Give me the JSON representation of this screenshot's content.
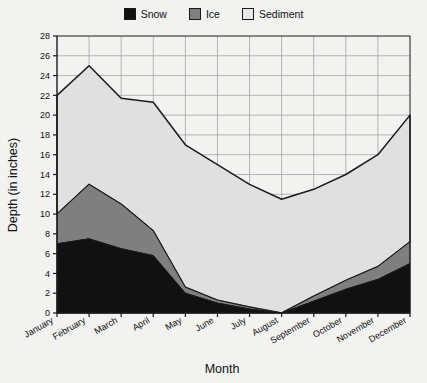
{
  "legend": {
    "items": [
      {
        "label": "Snow",
        "color": "#111111"
      },
      {
        "label": "Ice",
        "color": "#7f7f7f"
      },
      {
        "label": "Sediment",
        "color": "#e0e0e0"
      }
    ]
  },
  "chart_data": {
    "type": "area",
    "stacked": true,
    "title": "",
    "xlabel": "Month",
    "ylabel": "Depth (in inches)",
    "categories": [
      "January",
      "February",
      "March",
      "April",
      "May",
      "June",
      "July",
      "August",
      "September",
      "October",
      "November",
      "December"
    ],
    "series": [
      {
        "name": "Snow",
        "color": "#111111",
        "values": [
          7.0,
          7.5,
          6.5,
          5.8,
          2.0,
          1.0,
          0.4,
          0.0,
          1.2,
          2.4,
          3.4,
          5.0
        ]
      },
      {
        "name": "Ice",
        "color": "#7f7f7f",
        "values": [
          3.0,
          5.5,
          4.5,
          2.5,
          0.6,
          0.3,
          0.2,
          0.0,
          0.5,
          0.9,
          1.3,
          2.2
        ]
      },
      {
        "name": "Sediment",
        "color": "#e0e0e0",
        "values": [
          12.0,
          12.0,
          10.7,
          13.0,
          14.4,
          13.7,
          12.4,
          11.5,
          10.8,
          10.7,
          11.3,
          12.8
        ]
      }
    ],
    "cumulative_top": [
      22.0,
      25.0,
      21.7,
      21.3,
      17.0,
      15.0,
      13.0,
      11.5,
      12.5,
      14.0,
      16.0,
      20.0
    ],
    "ylim": [
      0,
      28
    ],
    "ytick_step": 2,
    "yticks": [
      0,
      2,
      4,
      6,
      8,
      10,
      12,
      14,
      16,
      18,
      20,
      22,
      24,
      26,
      28
    ],
    "grid": true,
    "legend_position": "top-center"
  }
}
